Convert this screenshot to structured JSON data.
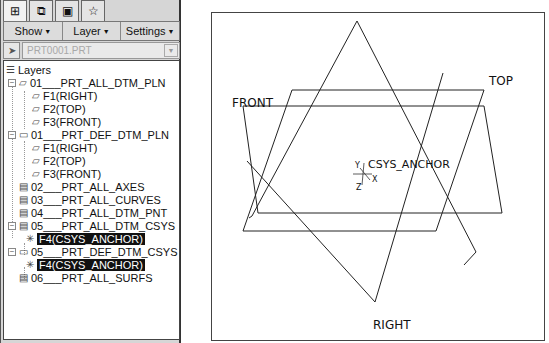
{
  "panel": {
    "tabs": [
      {
        "icon": "model-tree-icon",
        "glyph": "⊞"
      },
      {
        "icon": "layers-icon",
        "glyph": "⧉"
      },
      {
        "icon": "folder-icon",
        "glyph": "▣"
      },
      {
        "icon": "favorites-icon",
        "glyph": "☆"
      }
    ],
    "menus": [
      {
        "label": "Show",
        "caret": "▼"
      },
      {
        "label": "Layer",
        "caret": "▼"
      },
      {
        "label": "Settings",
        "caret": "▼"
      }
    ],
    "model_selector": {
      "value": "PRT0001.PRT",
      "caret": "▼",
      "arrow_glyph": "➤"
    },
    "tree": {
      "root": "Layers",
      "items": [
        {
          "label": "01___PRT_ALL_DTM_PLN",
          "expander": "−",
          "level": 1
        },
        {
          "label": "F1(RIGHT)",
          "level": 2
        },
        {
          "label": "F2(TOP)",
          "level": 2
        },
        {
          "label": "F3(FRONT)",
          "level": 2
        },
        {
          "label": "01___PRT_DEF_DTM_PLN",
          "expander": "−",
          "level": 1
        },
        {
          "label": "F1(RIGHT)",
          "level": 2
        },
        {
          "label": "F2(TOP)",
          "level": 2
        },
        {
          "label": "F3(FRONT)",
          "level": 2
        },
        {
          "label": "02___PRT_ALL_AXES",
          "level": 1
        },
        {
          "label": "03___PRT_ALL_CURVES",
          "level": 1
        },
        {
          "label": "04___PRT_ALL_DTM_PNT",
          "level": 1
        },
        {
          "label": "05___PRT_ALL_DTM_CSYS",
          "expander": "−",
          "level": 1
        },
        {
          "label": "F4(CSYS_ANCHOR)",
          "level": 2,
          "selected": true
        },
        {
          "label": "05___PRT_DEF_DTM_CSYS",
          "expander": "−",
          "level": 1
        },
        {
          "label": "F4(CSYS_ANCHOR)",
          "level": 2,
          "selected": true
        },
        {
          "label": "06___PRT_ALL_SURFS",
          "level": 1
        }
      ]
    }
  },
  "viewport": {
    "labels": {
      "front": "FRONT",
      "top": "TOP",
      "right": "RIGHT",
      "csys": "CSYS_ANCHOR",
      "axis_x": "X",
      "axis_y": "Y",
      "axis_z": "Z"
    }
  }
}
